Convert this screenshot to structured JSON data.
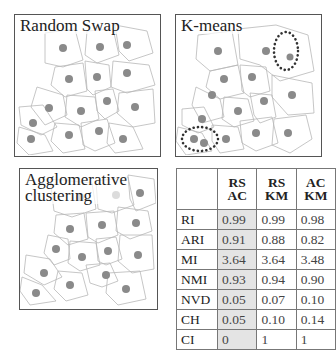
{
  "panels": {
    "random_swap": {
      "title": "Random Swap"
    },
    "kmeans": {
      "title": "K-means"
    },
    "agglomerative": {
      "title_line1": "Agglomerative",
      "title_line2": "clustering"
    }
  },
  "table": {
    "columns": [
      {
        "line1": "RS",
        "line2": "AC"
      },
      {
        "line1": "RS",
        "line2": "KM"
      },
      {
        "line1": "AC",
        "line2": "KM"
      }
    ],
    "rows": [
      {
        "metric": "RI",
        "values": [
          "0.99",
          "0.99",
          "0.98"
        ]
      },
      {
        "metric": "ARI",
        "values": [
          "0.91",
          "0.88",
          "0.82"
        ]
      },
      {
        "metric": "MI",
        "values": [
          "3.64",
          "3.64",
          "3.48"
        ]
      },
      {
        "metric": "NMI",
        "values": [
          "0.93",
          "0.94",
          "0.90"
        ]
      },
      {
        "metric": "NVD",
        "values": [
          "0.05",
          "0.07",
          "0.10"
        ]
      },
      {
        "metric": "CH",
        "values": [
          "0.05",
          "0.10",
          "0.14"
        ]
      },
      {
        "metric": "CI",
        "values": [
          "0",
          "1",
          "1"
        ]
      }
    ],
    "highlight_column_color": "#e4e4e4"
  },
  "colors": {
    "centroid": "#8a8a8a",
    "cell_border": "#b5b5b5",
    "highlight_circle": "#333333"
  }
}
